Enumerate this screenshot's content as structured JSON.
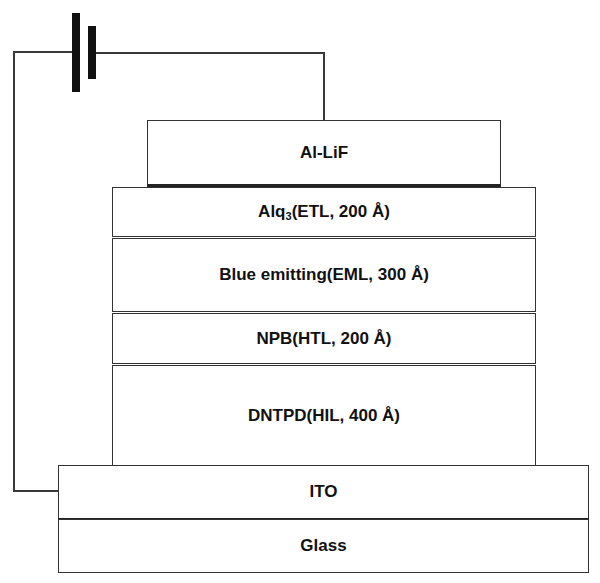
{
  "diagram": {
    "battery": {
      "name": "DC voltage source"
    },
    "layers": [
      {
        "id": "al-lif",
        "label_main": "Al-LiF",
        "label_sub": "",
        "label_rest": "",
        "role": "cathode"
      },
      {
        "id": "alq3",
        "label_main": "Alq",
        "label_sub": "3",
        "label_rest": "(ETL, 200 Å)",
        "thickness": "200 Å",
        "role": "ETL"
      },
      {
        "id": "eml",
        "label_main": "Blue emitting(EML, 300 Å)",
        "label_sub": "",
        "label_rest": "",
        "thickness": "300 Å",
        "role": "EML"
      },
      {
        "id": "npb",
        "label_main": "NPB(HTL, 200 Å)",
        "label_sub": "",
        "label_rest": "",
        "thickness": "200 Å",
        "role": "HTL"
      },
      {
        "id": "dntpd",
        "label_main": "DNTPD(HIL, 400 Å)",
        "label_sub": "",
        "label_rest": "",
        "thickness": "400 Å",
        "role": "HIL"
      },
      {
        "id": "ito",
        "label_main": "ITO",
        "label_sub": "",
        "label_rest": "",
        "role": "anode"
      },
      {
        "id": "glass",
        "label_main": "Glass",
        "label_sub": "",
        "label_rest": "",
        "role": "substrate"
      }
    ]
  }
}
